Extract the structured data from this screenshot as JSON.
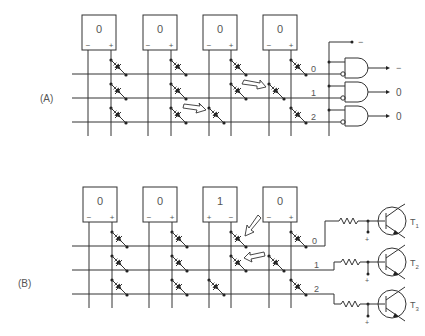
{
  "panels": [
    {
      "label": "(A)",
      "displays": [
        {
          "value": "0",
          "left": "−",
          "right": "+"
        },
        {
          "value": "0",
          "left": "−",
          "right": "+"
        },
        {
          "value": "0",
          "left": "−",
          "right": "+"
        },
        {
          "value": "0",
          "left": "−",
          "right": "+"
        }
      ],
      "rows": [
        "0",
        "1",
        "2"
      ],
      "bus_label": "−",
      "outputs": [
        "−",
        "0",
        "0"
      ]
    },
    {
      "label": "(B)",
      "displays": [
        {
          "value": "0",
          "left": "−",
          "right": "+"
        },
        {
          "value": "0",
          "left": "−",
          "right": "+"
        },
        {
          "value": "1",
          "left": "+",
          "right": "−"
        },
        {
          "value": "0",
          "left": "−",
          "right": "+"
        }
      ],
      "rows": [
        "0",
        "1",
        "2"
      ],
      "transistors": [
        "T1",
        "T2",
        "T3"
      ],
      "transistor_subs": [
        "1",
        "2",
        "3"
      ],
      "supply": [
        "+",
        "+",
        "+"
      ]
    }
  ]
}
